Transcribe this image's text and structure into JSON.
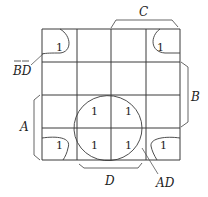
{
  "diagram": {
    "type": "karnaugh-map",
    "rows": 4,
    "cols": 4,
    "cells": [
      {
        "row": 0,
        "col": 0,
        "value": "1"
      },
      {
        "row": 0,
        "col": 3,
        "value": "1"
      },
      {
        "row": 2,
        "col": 1,
        "value": "1"
      },
      {
        "row": 2,
        "col": 2,
        "value": "1"
      },
      {
        "row": 3,
        "col": 0,
        "value": "1"
      },
      {
        "row": 3,
        "col": 1,
        "value": "1"
      },
      {
        "row": 3,
        "col": 2,
        "value": "1"
      },
      {
        "row": 3,
        "col": 3,
        "value": "1"
      }
    ],
    "labels": {
      "C": "C",
      "B": "B",
      "A": "A",
      "D": "D",
      "BD_bar": "BD",
      "AD": "AD"
    }
  }
}
